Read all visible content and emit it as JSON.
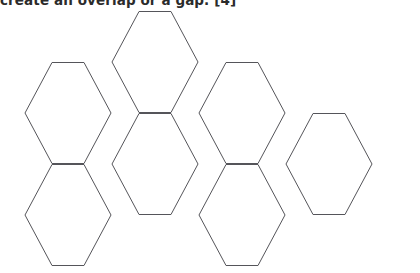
{
  "page": {
    "background_color": "#ffffff",
    "width": 420,
    "height": 273
  },
  "caption": {
    "text": "create an overlap or a gap. [4]",
    "note": "clipped text line at top edge of scan",
    "color": "#2b2b2b"
  },
  "figure": {
    "name": "hexagonal-tessellation",
    "shape": "hexagon",
    "orientation": "flat-top",
    "count": 7,
    "stroke_color": "#55555a",
    "fill_color": "#ffffff",
    "stroke_width": 1,
    "hex_width": 86,
    "hex_height": 101,
    "cells": [
      {
        "id": "hex-top-center",
        "cx": 155,
        "cy": 62
      },
      {
        "id": "hex-mid-left",
        "cx": 68,
        "cy": 113
      },
      {
        "id": "hex-mid-center",
        "cx": 155,
        "cy": 164
      },
      {
        "id": "hex-mid-right",
        "cx": 242,
        "cy": 113
      },
      {
        "id": "hex-far-right",
        "cx": 329,
        "cy": 164
      },
      {
        "id": "hex-bottom-left",
        "cx": 68,
        "cy": 215
      },
      {
        "id": "hex-bottom-center",
        "cx": 242,
        "cy": 215
      }
    ]
  }
}
